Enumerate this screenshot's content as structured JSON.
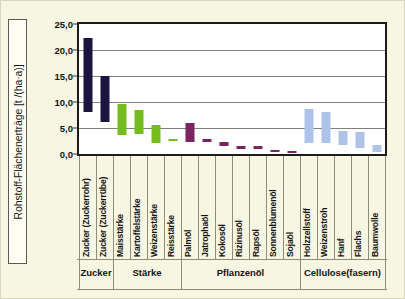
{
  "figure": {
    "background_color": "#f7f6e3",
    "plot_background_color": "#ffffff",
    "frame_color": "#1b1b1b"
  },
  "axis": {
    "y_title": "Rohstoff-Flächenerträge  [t /(ha·a)]",
    "y_ticks": [
      "0,0",
      "5,0",
      "10,0",
      "15,0",
      "20,0",
      "25,0"
    ]
  },
  "colors": {
    "zucker": "#1b1340",
    "staerke": "#76bc21",
    "pflanzenoel": "#7b2461",
    "cellulose": "#aec3e8"
  },
  "groups": [
    {
      "label": "Zucker",
      "count": 2
    },
    {
      "label": "Stärke",
      "count": 4
    },
    {
      "label": "Pflanzenöl",
      "count": 7
    },
    {
      "label": "Cellulose(fasern)",
      "count": 5
    }
  ],
  "chart_data": {
    "type": "bar",
    "title": "",
    "subtitle": "",
    "xlabel": "",
    "ylabel": "Rohstoff-Flächenerträge  [t /(ha·a)]",
    "ylim": [
      0,
      25
    ],
    "y_tick_values": [
      0,
      5,
      10,
      15,
      20,
      25
    ],
    "grid": true,
    "legend": "none",
    "value_style": "range-bars (low-high)",
    "categories": [
      "Zucker (Zuckerrohr)",
      "Zucker (Zuckerrübe)",
      "Maisstärke",
      "Kartoffelstärke",
      "Weizenstärke",
      "Reisstärke",
      "Palmöl",
      "Jatrophaöl",
      "Kokosöl",
      "Rizinusöl",
      "Rapsöl",
      "Sonnenblumenöl",
      "Sojaöl",
      "Holzzellstoff",
      "Weizenstroh",
      "Hanf",
      "Flachs",
      "Baumwolle"
    ],
    "group_of_category": [
      "Zucker",
      "Zucker",
      "Stärke",
      "Stärke",
      "Stärke",
      "Stärke",
      "Pflanzenöl",
      "Pflanzenöl",
      "Pflanzenöl",
      "Pflanzenöl",
      "Pflanzenöl",
      "Pflanzenöl",
      "Pflanzenöl",
      "Cellulose(fasern)",
      "Cellulose(fasern)",
      "Cellulose(fasern)",
      "Cellulose(fasern)",
      "Cellulose(fasern)"
    ],
    "bars": [
      {
        "category": "Zucker (Zuckerrohr)",
        "low": 8.0,
        "high": 22.4,
        "color": "#1b1340"
      },
      {
        "category": "Zucker (Zuckerrübe)",
        "low": 6.2,
        "high": 15.0,
        "color": "#1b1340"
      },
      {
        "category": "Maisstärke",
        "low": 3.6,
        "high": 9.6,
        "color": "#76bc21"
      },
      {
        "category": "Kartoffelstärke",
        "low": 3.9,
        "high": 8.4,
        "color": "#76bc21"
      },
      {
        "category": "Weizenstärke",
        "low": 2.2,
        "high": 5.6,
        "color": "#76bc21"
      },
      {
        "category": "Reisstärke",
        "low": 2.5,
        "high": 2.9,
        "color": "#76bc21"
      },
      {
        "category": "Palmöl",
        "low": 2.4,
        "high": 6.0,
        "color": "#7b2461"
      },
      {
        "category": "Jatrophaöl",
        "low": 2.4,
        "high": 2.8,
        "color": "#7b2461"
      },
      {
        "category": "Kokosöl",
        "low": 1.5,
        "high": 2.3,
        "color": "#7b2461"
      },
      {
        "category": "Rizinusöl",
        "low": 1.0,
        "high": 1.6,
        "color": "#7b2461"
      },
      {
        "category": "Rapsöl",
        "low": 1.0,
        "high": 1.5,
        "color": "#7b2461"
      },
      {
        "category": "Sonnenblumenöl",
        "low": 0.5,
        "high": 0.8,
        "color": "#7b2461"
      },
      {
        "category": "Sojaöl",
        "low": 0.4,
        "high": 0.6,
        "color": "#7b2461"
      },
      {
        "category": "Holzzellstoff",
        "low": 2.2,
        "high": 8.6,
        "color": "#aec3e8"
      },
      {
        "category": "Weizenstroh",
        "low": 2.1,
        "high": 8.0,
        "color": "#aec3e8"
      },
      {
        "category": "Hanf",
        "low": 1.8,
        "high": 4.5,
        "color": "#aec3e8"
      },
      {
        "category": "Flachs",
        "low": 1.2,
        "high": 4.2,
        "color": "#aec3e8"
      },
      {
        "category": "Baumwolle",
        "low": 0.3,
        "high": 1.7,
        "color": "#aec3e8"
      }
    ]
  }
}
